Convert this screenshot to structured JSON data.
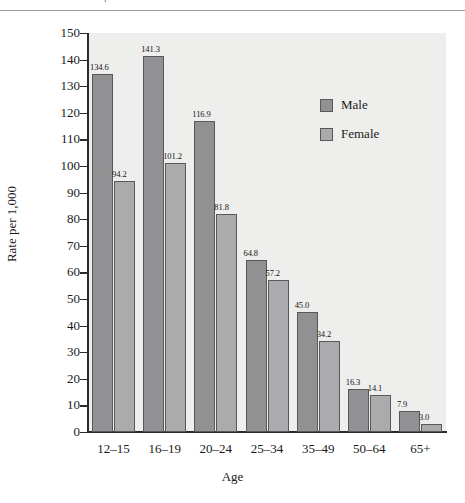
{
  "header": {
    "running_text": "and Distribution of Delinquent Behavior",
    "visible": true
  },
  "chart_data": {
    "type": "bar",
    "title": "",
    "xlabel": "Age",
    "ylabel": "Rate per 1,000",
    "categories": [
      "12–15",
      "16–19",
      "20–24",
      "25–34",
      "35–49",
      "50–64",
      "65+"
    ],
    "series": [
      {
        "name": "Male",
        "color": "#919193",
        "values": [
          134.6,
          141.3,
          116.9,
          64.8,
          45.0,
          16.3,
          7.9
        ]
      },
      {
        "name": "Female",
        "color": "#abaaac",
        "values": [
          94.2,
          101.2,
          81.8,
          57.2,
          34.2,
          14.1,
          3.0
        ]
      }
    ],
    "ylim": [
      0,
      150
    ],
    "yticks": [
      0,
      10,
      20,
      30,
      40,
      50,
      60,
      70,
      80,
      90,
      100,
      110,
      120,
      130,
      140,
      150
    ],
    "grid": false,
    "legend_position": "inside-upper-right",
    "data_labels": true,
    "plot_background": "#eeeeec",
    "axis_color": "#2b2b2b"
  }
}
